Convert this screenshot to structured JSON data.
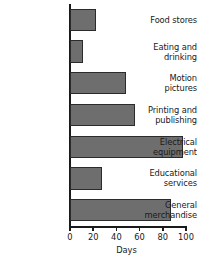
{
  "chart_data": {
    "type": "bar",
    "orientation": "horizontal",
    "title": "",
    "xlabel": "Days",
    "ylabel": "",
    "xlim": [
      0,
      100
    ],
    "xticks": [
      0,
      20,
      40,
      60,
      80,
      100
    ],
    "grid": false,
    "legend": null,
    "bar_color": "#6e6e6e",
    "bar_edge_color": "#2b2b2b",
    "axis_color": "#1a1a1a",
    "categories": [
      "Food stores",
      "Eating and drinking",
      "Motion pictures",
      "Printing and publishing",
      "Electrical equipment",
      "Educational services",
      "General merchandise"
    ],
    "category_lines": [
      [
        "Food stores"
      ],
      [
        "Eating and",
        "drinking"
      ],
      [
        "Motion",
        "pictures"
      ],
      [
        "Printing and",
        "publishing"
      ],
      [
        "Electrical",
        "equipment"
      ],
      [
        "Educational",
        "services"
      ],
      [
        "General",
        "merchandise"
      ]
    ],
    "values": [
      22,
      11,
      48,
      56,
      97,
      28,
      87
    ]
  }
}
